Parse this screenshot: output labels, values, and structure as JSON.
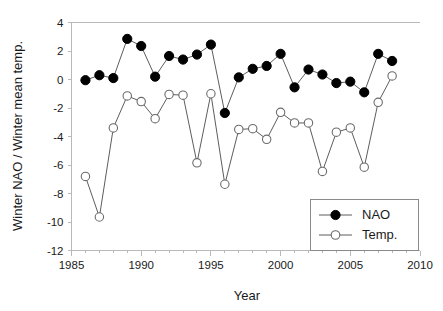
{
  "chart_data": {
    "type": "line",
    "title": "",
    "xlabel": "Year",
    "ylabel": "Winter NAO / Winter mean temp.",
    "xlim": [
      1985,
      2010
    ],
    "ylim": [
      -12,
      4
    ],
    "xticks": [
      1985,
      1990,
      1995,
      2000,
      2005,
      2010
    ],
    "xtick_labels": [
      "1985",
      "1990",
      "1995",
      "2000",
      "2005",
      "2010"
    ],
    "yticks": [
      4,
      2,
      0,
      -2,
      -4,
      -6,
      -8,
      -10,
      -12
    ],
    "ytick_labels": [
      "4",
      "2",
      "0",
      "-2",
      "-4",
      "-6",
      "-8",
      "-10",
      "-12"
    ],
    "minor_xtick_step": 1,
    "grid": false,
    "legend_position": "bottom-right",
    "x": [
      1986,
      1987,
      1988,
      1989,
      1990,
      1991,
      1992,
      1993,
      1994,
      1995,
      1996,
      1997,
      1998,
      1999,
      2000,
      2001,
      2002,
      2003,
      2004,
      2005,
      2006,
      2007,
      2008
    ],
    "series": [
      {
        "name": "NAO",
        "marker": "filled-circle",
        "color": "#000000",
        "values": [
          -0.05,
          0.3,
          0.1,
          2.85,
          2.35,
          0.2,
          1.65,
          1.4,
          1.75,
          2.45,
          -2.35,
          0.15,
          0.75,
          0.95,
          1.8,
          -0.55,
          0.7,
          0.35,
          -0.25,
          -0.15,
          -0.9,
          1.8,
          1.3
        ]
      },
      {
        "name": "Temp.",
        "marker": "open-circle",
        "color": "#6b6b6b",
        "values": [
          -6.8,
          -9.65,
          -3.4,
          -1.15,
          -1.55,
          -2.75,
          -1.05,
          -1.1,
          -5.85,
          -1.0,
          -7.35,
          -3.5,
          -3.45,
          -4.2,
          -2.3,
          -3.05,
          -3.05,
          -6.45,
          -3.7,
          -3.4,
          -6.15,
          -1.6,
          0.25
        ]
      }
    ]
  },
  "legend": {
    "entries": [
      {
        "label": "NAO"
      },
      {
        "label": "Temp."
      }
    ]
  }
}
